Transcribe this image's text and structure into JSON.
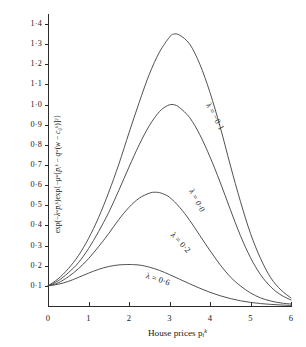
{
  "chart_data": {
    "type": "line",
    "title": "",
    "xlabel": "House prices  p",
    "xlabel_sub": "i",
    "xlabel_sup": "k",
    "ylabel_text": "exp(−λʷp̄ᵢᵏ)exp{−μʷ[p̄ᵢᵏ − qʷ(w − cᵢⱼᵏ)]²}",
    "xlim": [
      0,
      6
    ],
    "ylim": [
      0,
      1.45
    ],
    "xticks": [
      "0",
      "1",
      "2",
      "3",
      "4",
      "5",
      "6"
    ],
    "xtick_values": [
      0,
      1,
      2,
      3,
      4,
      5,
      6
    ],
    "yticks": [
      "0·1",
      "0·2",
      "0·3",
      "0·4",
      "0·5",
      "0·6",
      "0·7",
      "0·8",
      "0·9",
      "1·0",
      "1·1",
      "1·2",
      "1·3",
      "1·4"
    ],
    "ytick_values": [
      0.1,
      0.2,
      0.3,
      0.4,
      0.5,
      0.6,
      0.7,
      0.8,
      0.9,
      1.0,
      1.1,
      1.2,
      1.3,
      1.4
    ],
    "grid": false,
    "legend_position": "inline-curve-labels",
    "line_color": "#3d3d3d",
    "axis_color": "#2b2b2b",
    "series": [
      {
        "name": "λ = −0·1",
        "label": "λ = −0·1",
        "lambda": -0.1,
        "label_x": 3.95,
        "label_y": 1.03,
        "label_rotation": 62,
        "x": [
          0,
          0.25,
          0.5,
          0.75,
          1.0,
          1.25,
          1.5,
          1.75,
          2.0,
          2.25,
          2.5,
          2.75,
          3.0,
          3.1,
          3.25,
          3.5,
          3.75,
          4.0,
          4.25,
          4.5,
          4.75,
          5.0,
          5.25,
          5.5,
          5.75,
          6.0
        ],
        "y": [
          0.1,
          0.135,
          0.185,
          0.25,
          0.335,
          0.44,
          0.565,
          0.705,
          0.86,
          1.01,
          1.15,
          1.26,
          1.335,
          1.35,
          1.345,
          1.3,
          1.2,
          1.06,
          0.89,
          0.7,
          0.52,
          0.36,
          0.235,
          0.14,
          0.08,
          0.04
        ]
      },
      {
        "name": "λ = 0·0",
        "label": "λ = 0·0",
        "lambda": 0.0,
        "label_x": 3.52,
        "label_y": 0.6,
        "label_rotation": 62,
        "x": [
          0,
          0.25,
          0.5,
          0.75,
          1.0,
          1.25,
          1.5,
          1.75,
          2.0,
          2.25,
          2.5,
          2.75,
          2.95,
          3.1,
          3.25,
          3.5,
          3.75,
          4.0,
          4.25,
          4.5,
          4.75,
          5.0,
          5.25,
          5.5,
          5.75,
          6.0
        ],
        "y": [
          0.1,
          0.125,
          0.165,
          0.215,
          0.285,
          0.37,
          0.465,
          0.575,
          0.69,
          0.8,
          0.895,
          0.965,
          0.995,
          1.0,
          0.985,
          0.935,
          0.85,
          0.74,
          0.615,
          0.48,
          0.35,
          0.24,
          0.155,
          0.095,
          0.055,
          0.03
        ]
      },
      {
        "name": "λ = 0·2",
        "label": "λ = 0·2",
        "lambda": 0.2,
        "label_x": 3.05,
        "label_y": 0.38,
        "label_rotation": 47,
        "x": [
          0,
          0.25,
          0.5,
          0.75,
          1.0,
          1.25,
          1.5,
          1.75,
          2.0,
          2.25,
          2.5,
          2.65,
          2.8,
          3.0,
          3.25,
          3.5,
          3.75,
          4.0,
          4.25,
          4.5,
          4.75,
          5.0,
          5.25,
          5.5,
          5.75,
          6.0
        ],
        "y": [
          0.1,
          0.115,
          0.145,
          0.185,
          0.235,
          0.295,
          0.36,
          0.43,
          0.49,
          0.535,
          0.56,
          0.565,
          0.56,
          0.54,
          0.49,
          0.425,
          0.35,
          0.275,
          0.205,
          0.145,
          0.1,
          0.065,
          0.04,
          0.025,
          0.015,
          0.01
        ]
      },
      {
        "name": "λ = 0·6",
        "label": "λ = 0·6",
        "lambda": 0.6,
        "label_x": 2.42,
        "label_y": 0.175,
        "label_rotation": 18,
        "x": [
          0,
          0.25,
          0.5,
          0.75,
          1.0,
          1.25,
          1.5,
          1.75,
          2.0,
          2.15,
          2.3,
          2.5,
          2.75,
          3.0,
          3.25,
          3.5,
          3.75,
          4.0,
          4.25,
          4.5,
          4.75,
          5.0,
          5.25,
          5.5,
          5.75,
          6.0
        ],
        "y": [
          0.1,
          0.108,
          0.122,
          0.142,
          0.163,
          0.182,
          0.196,
          0.204,
          0.206,
          0.205,
          0.202,
          0.193,
          0.177,
          0.156,
          0.133,
          0.11,
          0.088,
          0.068,
          0.051,
          0.037,
          0.026,
          0.018,
          0.012,
          0.008,
          0.005,
          0.003
        ]
      }
    ]
  },
  "caption": ""
}
